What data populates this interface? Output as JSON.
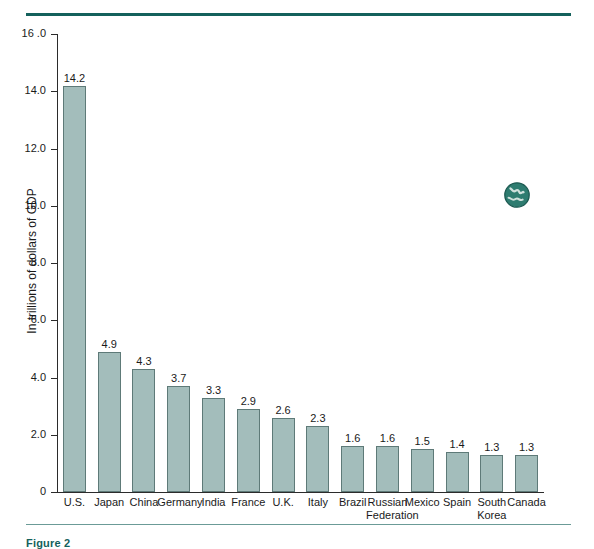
{
  "figure": {
    "caption": "Figure 2",
    "rule_color_top": "#14615c",
    "rule_color_bottom": "#6b9b97",
    "globe_icon": "globe-icon"
  },
  "chart_data": {
    "type": "bar",
    "title": "",
    "subtitle": "",
    "xlabel": "",
    "ylabel": "In trillions of dollars of GDP",
    "ylim": [
      0,
      16
    ],
    "yticks": [
      "0",
      "2.0",
      "4.0",
      "6.0",
      "8.0",
      "10.0",
      "12.0",
      "14.0",
      "16 .0"
    ],
    "ytick_values": [
      0,
      2,
      4,
      6,
      8,
      10,
      12,
      14,
      16
    ],
    "grid": false,
    "legend": null,
    "bar_color": "#a3bdbb",
    "bar_edge_color": "#5e7a78",
    "categories": [
      "U.S.",
      "Japan",
      "China",
      "Germany",
      "India",
      "France",
      "U.K.",
      "Italy",
      "Brazil",
      "Russian Federation",
      "Mexico",
      "Spain",
      "South Korea",
      "Canada"
    ],
    "category_lines": [
      [
        "U.S."
      ],
      [
        "Japan"
      ],
      [
        "China"
      ],
      [
        "Germany"
      ],
      [
        "India"
      ],
      [
        "France"
      ],
      [
        "U.K."
      ],
      [
        "Italy"
      ],
      [
        "Brazil"
      ],
      [
        "Russian",
        "Federation"
      ],
      [
        "Mexico"
      ],
      [
        "Spain"
      ],
      [
        "South",
        "Korea"
      ],
      [
        "Canada"
      ]
    ],
    "values": [
      14.2,
      4.9,
      4.3,
      3.7,
      3.3,
      2.9,
      2.6,
      2.3,
      1.6,
      1.6,
      1.5,
      1.4,
      1.3,
      1.3
    ],
    "value_labels": [
      "14.2",
      "4.9",
      "4.3",
      "3.7",
      "3.3",
      "2.9",
      "2.6",
      "2.3",
      "1.6",
      "1.6",
      "1.5",
      "1.4",
      "1.3",
      "1.3"
    ]
  }
}
